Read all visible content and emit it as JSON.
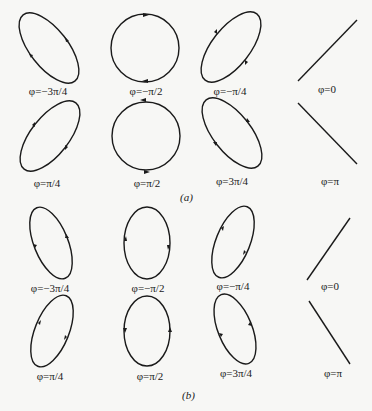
{
  "colors": {
    "stroke": "#1a1a1a",
    "background": "#f7f7f5"
  },
  "part_a": {
    "caption": "(a)",
    "labels": [
      "φ=−3π/4",
      "φ=−π/2",
      "φ=−π/4",
      "φ=0",
      "φ=π/4",
      "φ=π/2",
      "φ=3π/4",
      "φ=π"
    ]
  },
  "part_b": {
    "caption": "(b)",
    "labels": [
      "φ=−3π/4",
      "φ=−π/2",
      "φ=−π/4",
      "φ=0",
      "φ=π/4",
      "φ=π/2",
      "φ=3π/4",
      "φ=π"
    ]
  }
}
